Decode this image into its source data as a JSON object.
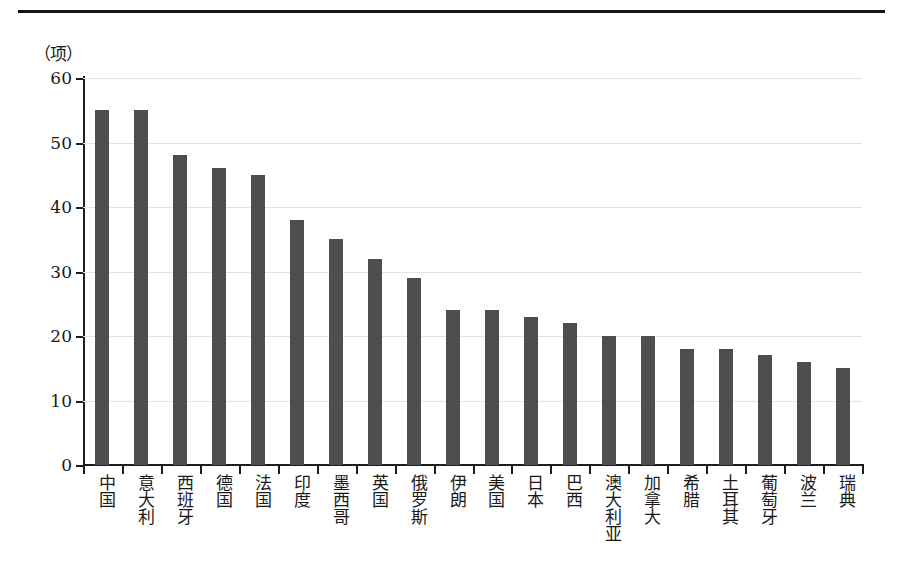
{
  "chart_data": {
    "type": "bar",
    "title": "",
    "subtitle": "",
    "xlabel": "",
    "ylabel": "（项）",
    "ylim": [
      0,
      60
    ],
    "ytick_values": [
      0,
      10,
      20,
      30,
      40,
      50,
      60
    ],
    "ytick_labels": [
      "0",
      "10",
      "20",
      "30",
      "40",
      "50",
      "60"
    ],
    "grid": true,
    "legend": null,
    "bar_color": "#4e4e4e",
    "categories": [
      "中国",
      "意大利",
      "西班牙",
      "德国",
      "法国",
      "印度",
      "墨西哥",
      "英国",
      "俄罗斯",
      "伊朗",
      "美国",
      "日本",
      "巴西",
      "澳大利亚",
      "加拿大",
      "希腊",
      "土耳其",
      "葡萄牙",
      "波兰",
      "瑞典"
    ],
    "values": [
      55,
      55,
      48,
      46,
      45,
      38,
      35,
      32,
      29,
      24,
      24,
      23,
      22,
      20,
      20,
      18,
      18,
      17,
      16,
      15
    ]
  },
  "figure": {
    "unit_caption": "（项）",
    "top_rule_color": "#141414",
    "axis_color": "#1d1d1d",
    "gridline_color": "#e3e3e3",
    "background": "#ffffff"
  }
}
